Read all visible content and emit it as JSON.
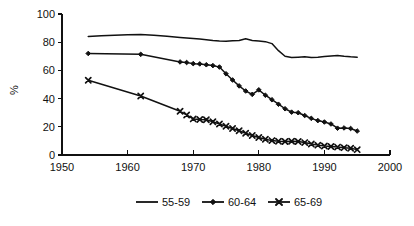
{
  "chart_data": {
    "type": "line",
    "title": "",
    "subtitle": "",
    "xlabel": "",
    "ylabel": "%",
    "xlim": [
      1950,
      2000
    ],
    "ylim": [
      0,
      100
    ],
    "x_ticks": [
      1950,
      1960,
      1970,
      1980,
      1990,
      2000
    ],
    "y_ticks": [
      0,
      20,
      40,
      60,
      80,
      100
    ],
    "x_tick_labels": [
      "1950",
      "1960",
      "1970",
      "1980",
      "1990",
      "2000"
    ],
    "y_tick_labels": [
      "0",
      "20",
      "40",
      "60",
      "80",
      "100"
    ],
    "grid": false,
    "legend_position": "bottom",
    "series": [
      {
        "name": "55-59",
        "marker": "none",
        "points": [
          [
            1954,
            84.0
          ],
          [
            1956,
            84.6
          ],
          [
            1958,
            85.0
          ],
          [
            1960,
            85.2
          ],
          [
            1962,
            85.4
          ],
          [
            1964,
            85.0
          ],
          [
            1966,
            84.2
          ],
          [
            1968,
            83.4
          ],
          [
            1969,
            83.0
          ],
          [
            1970,
            82.6
          ],
          [
            1971,
            82.2
          ],
          [
            1972,
            81.8
          ],
          [
            1973,
            81.2
          ],
          [
            1974,
            80.8
          ],
          [
            1975,
            80.6
          ],
          [
            1976,
            81.0
          ],
          [
            1977,
            81.2
          ],
          [
            1978,
            82.4
          ],
          [
            1979,
            81.2
          ],
          [
            1980,
            80.8
          ],
          [
            1981,
            80.4
          ],
          [
            1982,
            79.0
          ],
          [
            1983,
            74.0
          ],
          [
            1984,
            70.0
          ],
          [
            1985,
            69.2
          ],
          [
            1986,
            69.4
          ],
          [
            1987,
            69.6
          ],
          [
            1988,
            69.2
          ],
          [
            1989,
            69.4
          ],
          [
            1990,
            69.8
          ],
          [
            1991,
            70.2
          ],
          [
            1992,
            70.6
          ],
          [
            1993,
            70.0
          ],
          [
            1994,
            69.6
          ],
          [
            1995,
            69.4
          ]
        ]
      },
      {
        "name": "60-64",
        "marker": "diamond",
        "points": [
          [
            1954,
            72.0
          ],
          [
            1962,
            71.4
          ],
          [
            1968,
            66.0
          ],
          [
            1969,
            65.6
          ],
          [
            1970,
            64.8
          ],
          [
            1971,
            64.6
          ],
          [
            1972,
            64.0
          ],
          [
            1973,
            63.4
          ],
          [
            1974,
            62.4
          ],
          [
            1975,
            57.6
          ],
          [
            1976,
            53.2
          ],
          [
            1977,
            49.0
          ],
          [
            1978,
            45.4
          ],
          [
            1979,
            43.0
          ],
          [
            1980,
            46.2
          ],
          [
            1981,
            42.4
          ],
          [
            1982,
            39.2
          ],
          [
            1983,
            36.0
          ],
          [
            1984,
            32.8
          ],
          [
            1985,
            30.4
          ],
          [
            1986,
            30.0
          ],
          [
            1987,
            28.0
          ],
          [
            1988,
            26.0
          ],
          [
            1989,
            24.4
          ],
          [
            1990,
            23.4
          ],
          [
            1991,
            22.0
          ],
          [
            1992,
            19.0
          ],
          [
            1993,
            19.2
          ],
          [
            1994,
            18.8
          ],
          [
            1995,
            17.0
          ]
        ]
      },
      {
        "name": "65-69",
        "marker": "x",
        "points": [
          [
            1954,
            53.0
          ],
          [
            1962,
            41.8
          ],
          [
            1968,
            31.0
          ],
          [
            1969,
            28.4
          ],
          [
            1970,
            25.6
          ],
          [
            1971,
            25.2
          ],
          [
            1972,
            25.0
          ],
          [
            1973,
            23.6
          ],
          [
            1974,
            22.0
          ],
          [
            1975,
            20.4
          ],
          [
            1976,
            18.8
          ],
          [
            1977,
            17.2
          ],
          [
            1978,
            15.4
          ],
          [
            1979,
            13.8
          ],
          [
            1980,
            12.4
          ],
          [
            1981,
            11.2
          ],
          [
            1982,
            10.2
          ],
          [
            1983,
            9.8
          ],
          [
            1984,
            9.6
          ],
          [
            1985,
            9.8
          ],
          [
            1986,
            9.6
          ],
          [
            1987,
            8.8
          ],
          [
            1988,
            7.8
          ],
          [
            1989,
            7.0
          ],
          [
            1990,
            6.4
          ],
          [
            1991,
            6.0
          ],
          [
            1992,
            5.6
          ],
          [
            1993,
            5.2
          ],
          [
            1994,
            4.8
          ],
          [
            1995,
            3.8
          ]
        ]
      }
    ]
  },
  "legend": {
    "items": [
      {
        "label": "55-59",
        "marker": "none"
      },
      {
        "label": "60-64",
        "marker": "diamond"
      },
      {
        "label": "65-69",
        "marker": "x"
      }
    ]
  },
  "colors": {
    "ink": "#111111",
    "background": "#ffffff"
  }
}
